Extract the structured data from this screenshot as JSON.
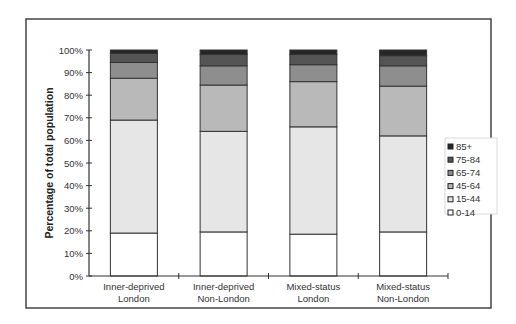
{
  "chart_data": {
    "type": "bar",
    "stacked": true,
    "title": "",
    "xlabel": "",
    "ylabel": "Percentage of total population",
    "ylim": [
      0,
      100
    ],
    "yticks": [
      "0%",
      "10%",
      "20%",
      "30%",
      "40%",
      "50%",
      "60%",
      "70%",
      "80%",
      "90%",
      "100%"
    ],
    "grid": false,
    "legend_position": "right",
    "categories": [
      [
        "Inner-deprived",
        "London"
      ],
      [
        "Inner-deprived",
        "Non-London"
      ],
      [
        "Mixed-status",
        "London"
      ],
      [
        "Mixed-status",
        "Non-London"
      ]
    ],
    "series": [
      {
        "name": "0-14",
        "color": "#ffffff",
        "values": [
          19,
          19.5,
          18.5,
          19.5
        ]
      },
      {
        "name": "15-44",
        "color": "#e6e6e6",
        "values": [
          50,
          44.5,
          47.5,
          42.5
        ]
      },
      {
        "name": "45-64",
        "color": "#b9b9b9",
        "values": [
          18.5,
          20.5,
          20,
          22
        ]
      },
      {
        "name": "65-74",
        "color": "#8e8e8e",
        "values": [
          7,
          8.5,
          7.5,
          9
        ]
      },
      {
        "name": "75-84",
        "color": "#555555",
        "values": [
          4,
          5,
          4.5,
          4.5
        ]
      },
      {
        "name": "85+",
        "color": "#262626",
        "values": [
          1.5,
          2,
          2,
          2.5
        ]
      }
    ],
    "legend_order": [
      "85+",
      "75-84",
      "65-74",
      "45-64",
      "15-44",
      "0-14"
    ]
  }
}
